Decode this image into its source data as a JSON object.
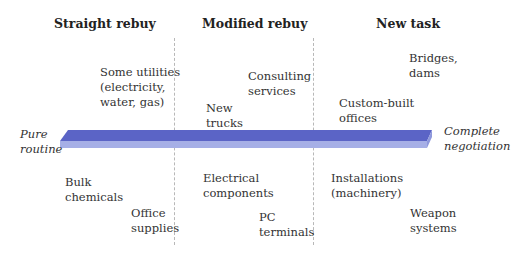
{
  "columns": [
    {
      "label": "Straight rebuy"
    },
    {
      "label": "Modified rebuy"
    },
    {
      "label": "New task"
    }
  ],
  "axis": {
    "left_label": "Pure\nroutine",
    "right_label": "Complete\nnegotiation",
    "bar_color_top": "#5b64c6",
    "bar_color_front": "#a6afe6"
  },
  "items_above": [
    {
      "text": "Some utilities\n(electricity,\nwater, gas)"
    },
    {
      "text": "New\ntrucks"
    },
    {
      "text": "Consulting\nservices"
    },
    {
      "text": "Custom-built\noffices"
    },
    {
      "text": "Bridges,\ndams"
    }
  ],
  "items_below": [
    {
      "text": "Bulk\nchemicals"
    },
    {
      "text": "Office\nsupplies"
    },
    {
      "text": "Electrical\ncomponents"
    },
    {
      "text": "PC\nterminals"
    },
    {
      "text": "Installations\n(machinery)"
    },
    {
      "text": "Weapon\nsystems"
    }
  ]
}
